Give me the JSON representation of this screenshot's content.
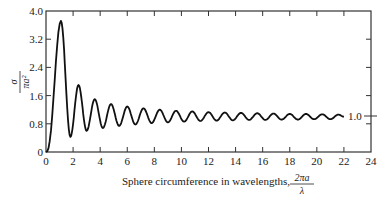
{
  "chart_data": {
    "type": "line",
    "title": "",
    "xlabel": "Sphere circumference in wavelengths,",
    "xlabel_fraction": {
      "numerator": "2πa",
      "denominator": "λ"
    },
    "ylabel_fraction": {
      "numerator": "σ",
      "denominator": "πa²"
    },
    "xlim": [
      0,
      24
    ],
    "ylim": [
      0,
      4.0
    ],
    "x_ticks": [
      "0",
      "2",
      "4",
      "6",
      "8",
      "10",
      "12",
      "14",
      "16",
      "18",
      "20",
      "22",
      "24"
    ],
    "y_ticks": [
      "0",
      "0.8",
      "1.6",
      "2.4",
      "3.2",
      "4.0"
    ],
    "grid": false,
    "legend": null,
    "annotations": [
      {
        "text": "1.0",
        "x": 22.0,
        "y": 1.0,
        "note": "asymptote marker on right axis"
      }
    ],
    "series": [
      {
        "name": "Normalized radar cross section of a conducting sphere",
        "extrema": {
          "x": [
            0.0,
            1.1,
            1.8,
            2.4,
            3.0,
            3.6,
            4.2,
            4.8,
            5.4,
            6.0,
            6.6,
            7.2,
            7.8,
            8.4,
            9.0,
            9.6,
            10.2,
            10.8,
            11.4,
            12.0,
            12.6,
            13.2,
            13.8,
            14.4,
            15.0,
            15.6,
            16.2,
            16.8,
            17.4,
            18.0,
            18.6,
            19.2,
            19.8,
            20.4,
            21.0,
            21.6,
            22.0
          ],
          "y": [
            0.0,
            3.72,
            0.43,
            1.9,
            0.6,
            1.5,
            0.68,
            1.36,
            0.74,
            1.29,
            0.78,
            1.24,
            0.82,
            1.2,
            0.84,
            1.17,
            0.86,
            1.15,
            0.88,
            1.13,
            0.89,
            1.12,
            0.9,
            1.11,
            0.91,
            1.1,
            0.91,
            1.09,
            0.92,
            1.08,
            0.92,
            1.08,
            0.93,
            1.07,
            0.93,
            1.06,
            1.0
          ]
        }
      }
    ]
  }
}
